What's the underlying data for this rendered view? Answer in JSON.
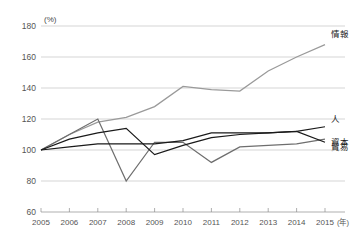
{
  "chart_data": {
    "type": "line",
    "title": "",
    "xlabel": "(年)",
    "ylabel": "(%)",
    "unit_top_label": "(%)",
    "x_axis_unit_label": "(年)",
    "grid": true,
    "legend_position": "right-end-of-line",
    "x": [
      2005,
      2006,
      2007,
      2008,
      2009,
      2010,
      2011,
      2012,
      2013,
      2014,
      2015
    ],
    "categories": [
      "2005",
      "2006",
      "2007",
      "2008",
      "2009",
      "2010",
      "2011",
      "2012",
      "2013",
      "2014",
      "2015"
    ],
    "xlim": [
      2005,
      2015
    ],
    "ylim": [
      60,
      180
    ],
    "y_ticks": [
      60,
      80,
      100,
      120,
      140,
      160,
      180
    ],
    "y_tick_labels": [
      "60",
      "80",
      "100",
      "120",
      "140",
      "160",
      "180"
    ],
    "series": [
      {
        "name": "情報",
        "label": "情報",
        "color": "#9a9a9a",
        "values": [
          100,
          110,
          118,
          121,
          128,
          141,
          139,
          138,
          151,
          160,
          168
        ]
      },
      {
        "name": "人",
        "label": "人",
        "color": "#1a1a1a",
        "values": [
          100,
          102,
          104,
          104,
          104,
          106,
          111,
          111,
          111,
          112,
          115
        ]
      },
      {
        "name": "資本",
        "label": "資本",
        "color": "#1a1a1a",
        "values": [
          100,
          107,
          111,
          114,
          97,
          103,
          108,
          110,
          111,
          112,
          105
        ]
      },
      {
        "name": "貿易",
        "label": "貿易",
        "color": "#6e6e6e",
        "values": [
          100,
          110,
          120,
          80,
          105,
          105,
          92,
          102,
          103,
          104,
          107
        ]
      }
    ]
  }
}
